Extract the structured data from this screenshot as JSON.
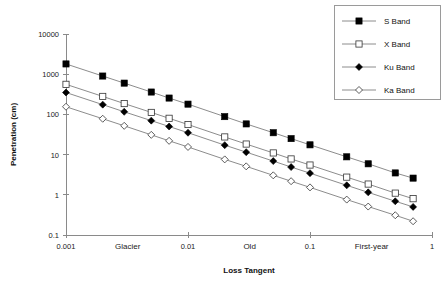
{
  "chart_data": {
    "type": "line",
    "title": "",
    "xlabel": "Loss Tangent",
    "ylabel": "Penetration (cm)",
    "xscale": "log",
    "yscale": "log",
    "xlim": [
      0.001,
      1
    ],
    "ylim": [
      0.1,
      10000
    ],
    "grid": false,
    "legend_position": "top-right",
    "xticks": [
      "0.001",
      "0.01",
      "0.1",
      "1"
    ],
    "xtick_values": [
      0.001,
      0.01,
      0.1,
      1
    ],
    "yticks": [
      "0.1",
      "1",
      "10",
      "100",
      "1000",
      "10000"
    ],
    "ytick_values": [
      0.1,
      1,
      10,
      100,
      1000,
      10000
    ],
    "region_annotations": [
      {
        "label": "Glacier",
        "x": 0.0032
      },
      {
        "label": "Old",
        "x": 0.032
      },
      {
        "label": "First-year",
        "x": 0.32
      }
    ],
    "x": [
      0.001,
      0.002,
      0.003,
      0.005,
      0.007,
      0.01,
      0.02,
      0.03,
      0.05,
      0.07,
      0.1,
      0.2,
      0.3,
      0.5,
      0.7
    ],
    "series": [
      {
        "name": "S Band",
        "marker": "filled-square",
        "color": "#000000",
        "values": [
          1800,
          900,
          600,
          360,
          255,
          180,
          88,
          58,
          35,
          25,
          17.5,
          8.8,
          5.9,
          3.5,
          2.6
        ]
      },
      {
        "name": "X Band",
        "marker": "open-square",
        "color": "#000000",
        "values": [
          560,
          280,
          186,
          112,
          80,
          56,
          27.5,
          18.3,
          11,
          7.8,
          5.5,
          2.75,
          1.85,
          1.1,
          0.8
        ]
      },
      {
        "name": "Ku Band",
        "marker": "filled-diamond",
        "color": "#000000",
        "values": [
          350,
          175,
          116,
          70,
          50,
          35,
          17.2,
          11.5,
          6.9,
          4.9,
          3.45,
          1.72,
          1.15,
          0.69,
          0.5
        ]
      },
      {
        "name": "Ka Band",
        "marker": "open-diamond",
        "color": "#000000",
        "values": [
          155,
          78,
          52,
          31,
          22,
          15.5,
          7.6,
          5.1,
          3.05,
          2.18,
          1.53,
          0.76,
          0.51,
          0.31,
          0.22
        ]
      }
    ]
  },
  "legend": {
    "entries": [
      {
        "label": "S Band"
      },
      {
        "label": "X Band"
      },
      {
        "label": "Ku Band"
      },
      {
        "label": "Ka Band"
      }
    ]
  }
}
